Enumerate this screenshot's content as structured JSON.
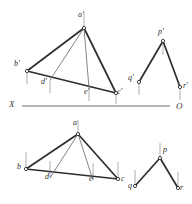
{
  "figure": {
    "type": "descriptive-geometry-projection",
    "title": "",
    "background_color": "#ffffff",
    "ink_color": "#2d2d2d",
    "light_ink_color": "#8a8a8a",
    "ground_line": {
      "left_label": "X",
      "right_label": "O",
      "y": 106,
      "x_start": 22,
      "x_end": 170,
      "color": "#9a9a9a"
    },
    "labels": [
      {
        "name": "a-prime",
        "text": "a'",
        "x": 78,
        "y": 11
      },
      {
        "name": "b-prime",
        "text": "b'",
        "x": 14,
        "y": 60
      },
      {
        "name": "d-prime",
        "text": "d'",
        "x": 41,
        "y": 78
      },
      {
        "name": "e-prime",
        "text": "e'",
        "x": 84,
        "y": 88
      },
      {
        "name": "c-prime",
        "text": "c'",
        "x": 117,
        "y": 88
      },
      {
        "name": "p-prime",
        "text": "p'",
        "x": 158,
        "y": 28
      },
      {
        "name": "q-prime",
        "text": "q'",
        "x": 128,
        "y": 74
      },
      {
        "name": "r-prime",
        "text": "r'",
        "x": 183,
        "y": 82
      },
      {
        "name": "x-axis",
        "text": "X",
        "x": 9,
        "y": 100
      },
      {
        "name": "o-axis",
        "text": "O",
        "x": 176,
        "y": 102
      },
      {
        "name": "a",
        "text": "a",
        "x": 73,
        "y": 119
      },
      {
        "name": "b",
        "text": "b",
        "x": 17,
        "y": 163
      },
      {
        "name": "d",
        "text": "d",
        "x": 45,
        "y": 173
      },
      {
        "name": "e",
        "text": "e",
        "x": 89,
        "y": 175
      },
      {
        "name": "c",
        "text": "c",
        "x": 121,
        "y": 175
      },
      {
        "name": "p",
        "text": "p",
        "x": 163,
        "y": 146
      },
      {
        "name": "q",
        "text": "q",
        "x": 128,
        "y": 182
      },
      {
        "name": "r",
        "text": "r",
        "x": 180,
        "y": 184
      }
    ],
    "points": {
      "a_prime": {
        "x": 84,
        "y": 28
      },
      "b_prime": {
        "x": 27,
        "y": 71
      },
      "c_prime": {
        "x": 116,
        "y": 93
      },
      "d_prime": {
        "x": 50,
        "y": 80
      },
      "e_prime": {
        "x": 89,
        "y": 88
      },
      "p_prime": {
        "x": 163,
        "y": 41
      },
      "q_prime": {
        "x": 139,
        "y": 82
      },
      "r_prime": {
        "x": 180,
        "y": 87
      },
      "a": {
        "x": 78,
        "y": 134
      },
      "b": {
        "x": 26,
        "y": 169
      },
      "c": {
        "x": 118,
        "y": 179
      },
      "d": {
        "x": 50,
        "y": 178
      },
      "e": {
        "x": 93,
        "y": 180
      },
      "p": {
        "x": 160,
        "y": 158
      },
      "q": {
        "x": 135,
        "y": 186
      },
      "r": {
        "x": 178,
        "y": 188
      }
    },
    "edges_upper_triangle": [
      "a'-b'",
      "a'-c'",
      "b'-c'",
      "a'-d'",
      "a'-e'"
    ],
    "edges_upper_vee": [
      "p'-q'",
      "p'-r'"
    ],
    "edges_lower_triangle": [
      "a-b",
      "a-c",
      "b-c",
      "a-d",
      "a-e"
    ],
    "edges_lower_vee": [
      "p-q",
      "p-r"
    ]
  }
}
